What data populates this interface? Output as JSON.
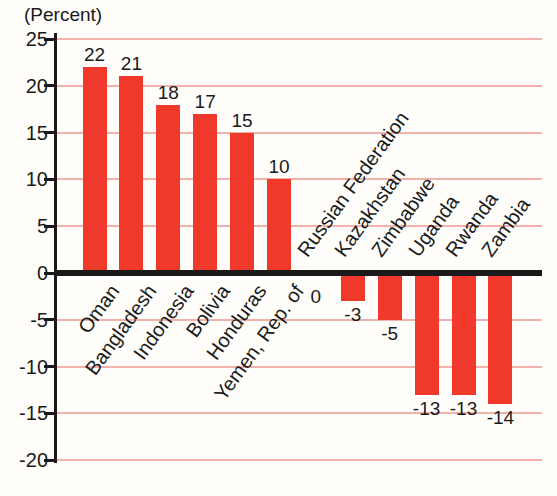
{
  "colors": {
    "bar": "#f1392b",
    "gridline": "#f2b2ab",
    "axis": "#1a1a1a",
    "text": "#1a1a1a",
    "background": "#fffefb"
  },
  "chart_data": {
    "type": "bar",
    "title": "",
    "ylabel": "(Percent)",
    "xlabel": "",
    "categories": [
      "Oman",
      "Bangladesh",
      "Indonesia",
      "Bolivia",
      "Honduras",
      "Yemen, Rep. of",
      "Russian Federation",
      "Kazakhstan",
      "Zimbabwe",
      "Uganda",
      "Rwanda",
      "Zambia"
    ],
    "values": [
      22,
      21,
      18,
      17,
      15,
      10,
      0,
      -3,
      -5,
      -13,
      -13,
      -14
    ],
    "value_labels": [
      "22",
      "21",
      "18",
      "17",
      "15",
      "10",
      "0",
      "-3",
      "-5",
      "-13",
      "-13",
      "-14"
    ],
    "ylim": [
      -20,
      25
    ],
    "ytick_interval": 5,
    "yticks": [
      25,
      20,
      15,
      10,
      5,
      0,
      -5,
      -10,
      -15,
      -20
    ],
    "ytick_labels": [
      "25",
      "20",
      "15",
      "10",
      "5",
      "0",
      "-5",
      "-10",
      "-15",
      "-20"
    ],
    "grid": true,
    "legend": false,
    "bar_color": "#f1392b"
  }
}
